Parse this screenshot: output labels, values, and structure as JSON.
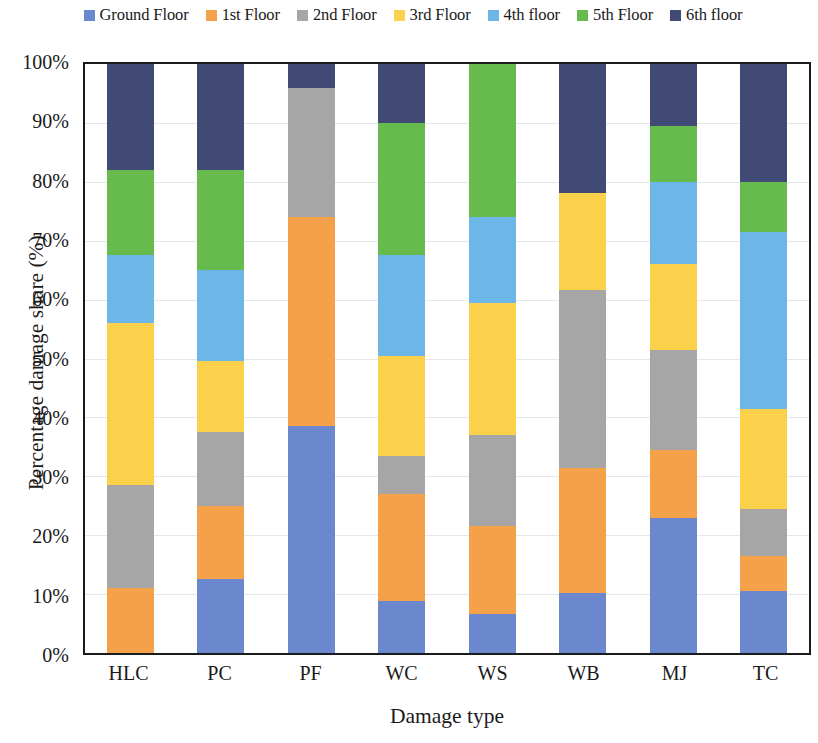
{
  "chart_data": {
    "type": "bar",
    "subtype": "stacked-percentage",
    "title": "",
    "xlabel": "Damage type",
    "ylabel": "Percentage damage share (%)",
    "ylim": [
      0,
      100
    ],
    "ytick_labels": [
      "0%",
      "10%",
      "20%",
      "30%",
      "40%",
      "50%",
      "60%",
      "70%",
      "80%",
      "90%",
      "100%"
    ],
    "ytick_values": [
      0,
      10,
      20,
      30,
      40,
      50,
      60,
      70,
      80,
      90,
      100
    ],
    "grid": true,
    "legend_position": "top",
    "categories": [
      "HLC",
      "PC",
      "PF",
      "WC",
      "WS",
      "WB",
      "MJ",
      "TC"
    ],
    "series": [
      {
        "name": "Ground Floor",
        "color": "#6B87CE",
        "values": [
          0,
          12.5,
          38.5,
          8.8,
          6.7,
          10.2,
          23.0,
          10.5
        ]
      },
      {
        "name": "1st Floor",
        "color": "#F5A149",
        "values": [
          11.0,
          12.5,
          35.5,
          18.2,
          14.8,
          21.3,
          11.5,
          6.0
        ]
      },
      {
        "name": "2nd Floor",
        "color": "#A6A6A6",
        "values": [
          17.5,
          12.5,
          22.0,
          6.5,
          15.5,
          30.2,
          17.0,
          8.0
        ]
      },
      {
        "name": "3rd Floor",
        "color": "#FBD04A",
        "values": [
          27.5,
          12.0,
          0,
          17.0,
          22.5,
          16.5,
          14.5,
          17.0
        ]
      },
      {
        "name": "4th floor",
        "color": "#6CB6E8",
        "values": [
          11.5,
          15.5,
          0,
          17.0,
          14.5,
          0,
          14.0,
          30.0
        ]
      },
      {
        "name": "5th Floor",
        "color": "#67BB4C",
        "values": [
          14.5,
          17.0,
          0,
          22.5,
          26.0,
          0,
          9.5,
          8.5
        ]
      },
      {
        "name": "6th floor",
        "color": "#404A74",
        "values": [
          18.0,
          18.0,
          4.0,
          10.0,
          0,
          22.0,
          10.5,
          20.0
        ]
      }
    ]
  }
}
